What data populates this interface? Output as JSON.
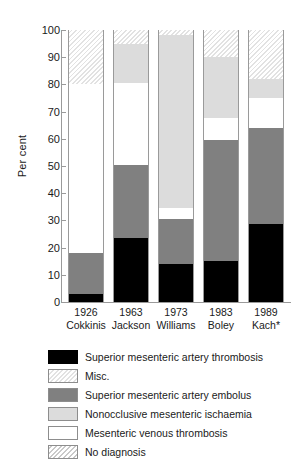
{
  "chart_data": {
    "type": "bar",
    "subtype": "stacked-bar-100",
    "title": "",
    "xlabel": "",
    "ylabel": "Per cent",
    "ylim": [
      0,
      100
    ],
    "yticks": [
      0,
      10,
      20,
      30,
      40,
      50,
      60,
      70,
      80,
      90,
      100
    ],
    "grid": false,
    "legend_position": "bottom",
    "categories": [
      {
        "year": "1926",
        "author": "Cokkinis"
      },
      {
        "year": "1963",
        "author": "Jackson"
      },
      {
        "year": "1973",
        "author": "Williams"
      },
      {
        "year": "1983",
        "author": "Boley"
      },
      {
        "year": "1989",
        "author": "Kach*"
      }
    ],
    "series": [
      {
        "name": "Superior mesenteric artery thrombosis",
        "style": "black",
        "color": "#000000",
        "values": [
          3,
          23.5,
          14,
          15,
          28.5
        ]
      },
      {
        "name": "Superior mesenteric artery embolus",
        "style": "dark-gray",
        "color": "#808080",
        "values": [
          15,
          27,
          16.5,
          44.5,
          35.5
        ]
      },
      {
        "name": "Mesenteric venous thrombosis",
        "style": "white",
        "color": "#ffffff",
        "values": [
          62,
          30,
          4,
          8,
          11
        ]
      },
      {
        "name": "Nonocclusive mesenteric ischaemia",
        "style": "light-gray",
        "color": "#dcdcdc",
        "values": [
          0,
          14.5,
          63.5,
          22.5,
          7
        ]
      },
      {
        "name": "No diagnosis",
        "style": "hatch-gray",
        "color": "#c9c9c9",
        "values": [
          0,
          0,
          0,
          0,
          0
        ]
      },
      {
        "name": "Misc.",
        "style": "hatch-light",
        "color": "#e2e2e2",
        "values": [
          20,
          5,
          2,
          10,
          18
        ]
      }
    ],
    "stack_order_bottom_to_top": [
      "Superior mesenteric artery thrombosis",
      "Superior mesenteric artery embolus",
      "Mesenteric venous thrombosis",
      "Nonocclusive mesenteric ischaemia",
      "Misc."
    ]
  },
  "axis": {
    "y_title": "Per cent",
    "y_ticks": [
      "100",
      "90",
      "80",
      "70",
      "60",
      "50",
      "40",
      "30",
      "20",
      "10",
      "0"
    ],
    "x_labels": [
      {
        "year": "1926",
        "author": "Cokkinis"
      },
      {
        "year": "1963",
        "author": "Jackson"
      },
      {
        "year": "1973",
        "author": "Williams"
      },
      {
        "year": "1983",
        "author": "Boley"
      },
      {
        "year": "1989",
        "author": "Kach*"
      }
    ]
  },
  "legend": {
    "items": [
      {
        "label": "Superior mesenteric artery thrombosis",
        "style": "black"
      },
      {
        "label": "Misc.",
        "style": "hatch-light"
      },
      {
        "label": "Superior mesenteric artery embolus",
        "style": "dark-gray"
      },
      {
        "label": "Nonocclusive mesenteric ischaemia",
        "style": "light-gray"
      },
      {
        "label": "Mesenteric venous thrombosis",
        "style": "white"
      },
      {
        "label": "No diagnosis",
        "style": "hatch-gray"
      }
    ]
  }
}
